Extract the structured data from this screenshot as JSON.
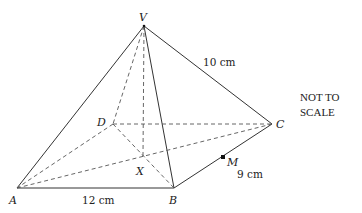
{
  "diagram": {
    "note_line1": "NOT TO",
    "note_line2": "SCALE",
    "vertices": {
      "V": {
        "label": "V",
        "x": 144,
        "y": 26
      },
      "A": {
        "label": "A",
        "x": 17,
        "y": 188
      },
      "B": {
        "label": "B",
        "x": 174,
        "y": 188
      },
      "C": {
        "label": "C",
        "x": 272,
        "y": 124
      },
      "D": {
        "label": "D",
        "x": 113,
        "y": 124
      },
      "X": {
        "label": "X",
        "x": 143,
        "y": 156
      },
      "M": {
        "label": "M",
        "x": 223,
        "y": 157
      }
    },
    "measurements": {
      "AB": "12 cm",
      "VC": "10 cm",
      "MC": "9 cm"
    },
    "edges_solid": [
      "VA",
      "VB",
      "VC",
      "AB",
      "BC"
    ],
    "edges_dashed": [
      "VD",
      "DA",
      "DC",
      "VX",
      "AC",
      "DB"
    ]
  }
}
